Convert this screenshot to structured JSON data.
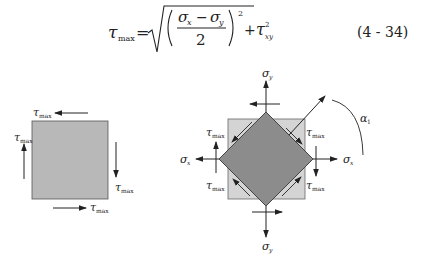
{
  "equation": {
    "lhs_symbol": "τ",
    "lhs_subscript": "max",
    "equals": "=",
    "numerator_left": "σ",
    "numerator_left_sub": "x",
    "minus": "−",
    "numerator_right": "σ",
    "numerator_right_sub": "y",
    "denominator": "2",
    "exponent": "2",
    "plus": "+",
    "tau_symbol": "τ",
    "tau_exponent": "2",
    "tau_subscript": "xy",
    "number": "(4 - 34)"
  },
  "figure_left": {
    "labels": {
      "top": {
        "sym": "τ",
        "sub": "max"
      },
      "left": {
        "sym": "τ",
        "sub": "max"
      },
      "right": {
        "sym": "τ",
        "sub": "max"
      },
      "bottom": {
        "sym": "τ",
        "sub": "max"
      }
    },
    "fill_color": "#b8b8b8"
  },
  "figure_right": {
    "labels": {
      "sigma_y_top": {
        "sym": "σ",
        "sub": "y"
      },
      "sigma_y_bottom": {
        "sym": "σ",
        "sub": "y"
      },
      "sigma_x_left": {
        "sym": "σ",
        "sub": "x"
      },
      "sigma_x_right": {
        "sym": "σ",
        "sub": "x"
      },
      "tau_top_left": {
        "sym": "τ",
        "sub": "max"
      },
      "tau_top_right": {
        "sym": "τ",
        "sub": "max"
      },
      "tau_bottom_left": {
        "sym": "τ",
        "sub": "max"
      },
      "tau_bottom_right": {
        "sym": "τ",
        "sub": "max"
      },
      "angle": {
        "sym": "α",
        "sub": "1"
      }
    },
    "outer_fill": "#d4d4d4",
    "diamond_fill": "#8c8c8c"
  }
}
